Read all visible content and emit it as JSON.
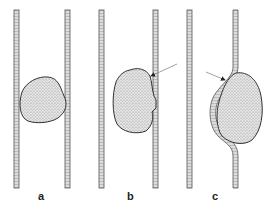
{
  "figure": {
    "panels": [
      {
        "id": "a",
        "label": "a",
        "description": "clot lodged freely in vessel lumen"
      },
      {
        "id": "b",
        "label": "b",
        "description": "clot adhering to vessel wall with arrow at attachment"
      },
      {
        "id": "c",
        "label": "c",
        "description": "clot deforming vessel wall with arrow at wall"
      }
    ],
    "colors": {
      "wall_outline": "#555555",
      "wall_fill": "#cfcfcf",
      "clot_fill": "#d8d8d8",
      "clot_outline": "#333333",
      "arrow": "#888888",
      "background": "#ffffff"
    }
  }
}
